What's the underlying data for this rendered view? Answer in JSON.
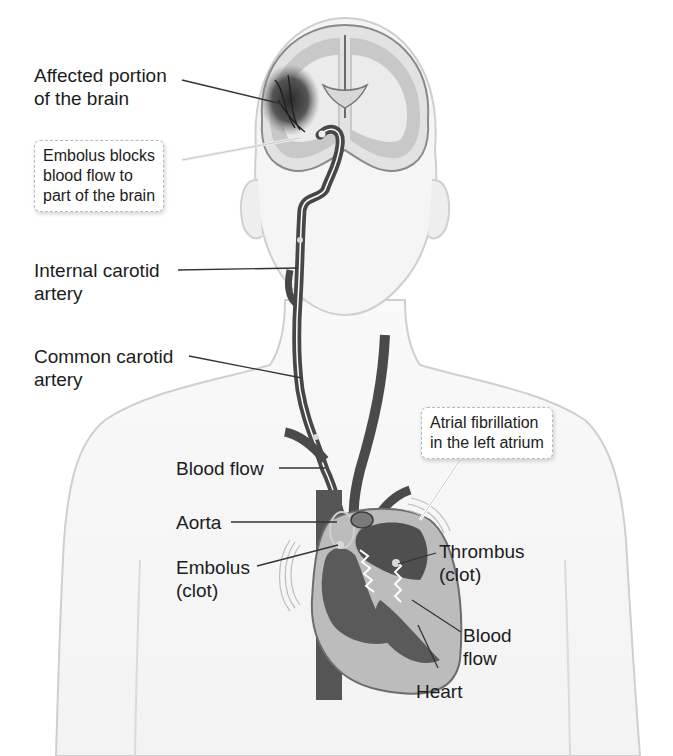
{
  "figure": {
    "colors": {
      "background": "#ffffff",
      "body_outline": "#c8c8c8",
      "body_fill": "#f6f6f6",
      "vessel": "#4a4a4a",
      "vessel_dark": "#3a3a3a",
      "flow_arrow": "#ffffff",
      "brain_gray_matter": "#a9a9a9",
      "brain_white_matter": "#e4e4e4",
      "affected_region": "#2e2e2e",
      "heart_wall": "#bdbdbd",
      "heart_chamber": "#555555",
      "leader_line": "#333333",
      "text": "#1c1c1c"
    }
  },
  "labels": {
    "affected_brain": {
      "line1": "Affected portion",
      "line2": "of the brain"
    },
    "embolus_blocks": {
      "line1": "Embolus blocks",
      "line2": "blood flow to",
      "line3": "part of the brain"
    },
    "internal_carotid": {
      "line1": "Internal carotid",
      "line2": "artery"
    },
    "common_carotid": {
      "line1": "Common carotid",
      "line2": "artery"
    },
    "atrial_fib": {
      "line1": "Atrial fibrillation",
      "line2": "in the left atrium"
    },
    "blood_flow_upper": {
      "line1": "Blood flow"
    },
    "aorta": {
      "line1": "Aorta"
    },
    "embolus_clot": {
      "line1": "Embolus",
      "line2": "(clot)"
    },
    "thrombus": {
      "line1": "Thrombus",
      "line2": "(clot)"
    },
    "blood_flow_heart": {
      "line1": "Blood",
      "line2": "flow"
    },
    "heart": {
      "line1": "Heart"
    }
  }
}
